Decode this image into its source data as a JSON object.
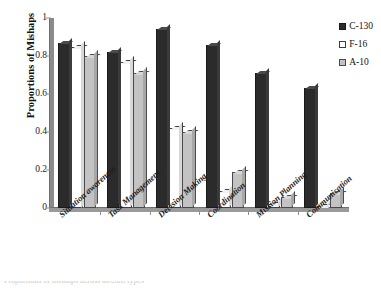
{
  "chart_data": {
    "type": "bar",
    "title": "",
    "xlabel": "",
    "ylabel": "Proportions of Mishaps",
    "ylim": [
      0,
      1
    ],
    "yticks": [
      "0",
      "0.2",
      "0.4",
      "0.6",
      "0.8",
      "1"
    ],
    "ytick_values": [
      0,
      0.2,
      0.4,
      0.6,
      0.8,
      1
    ],
    "grid": false,
    "legend_position": "top-right",
    "categories": [
      "Situation awareness",
      "Task Management",
      "Decision Making",
      "Coordination",
      "Mission Planning",
      "Communication"
    ],
    "series": [
      {
        "name": "C-130",
        "color": "#2b2b2b",
        "values": [
          0.87,
          0.82,
          0.94,
          0.86,
          0.71,
          0.63
        ]
      },
      {
        "name": "F-16",
        "color": "#ffffff",
        "values": [
          0.85,
          0.77,
          0.42,
          0.09,
          0.02,
          0.01
        ]
      },
      {
        "name": "A-10",
        "color": "#c3c3c3",
        "values": [
          0.8,
          0.71,
          0.4,
          0.19,
          0.06,
          0.08
        ]
      }
    ]
  },
  "legend": {
    "items": [
      {
        "label": "C-130"
      },
      {
        "label": "F-16"
      },
      {
        "label": "A-10"
      }
    ]
  },
  "caption": {
    "text": "Proportions of mishaps across aircraft types"
  }
}
